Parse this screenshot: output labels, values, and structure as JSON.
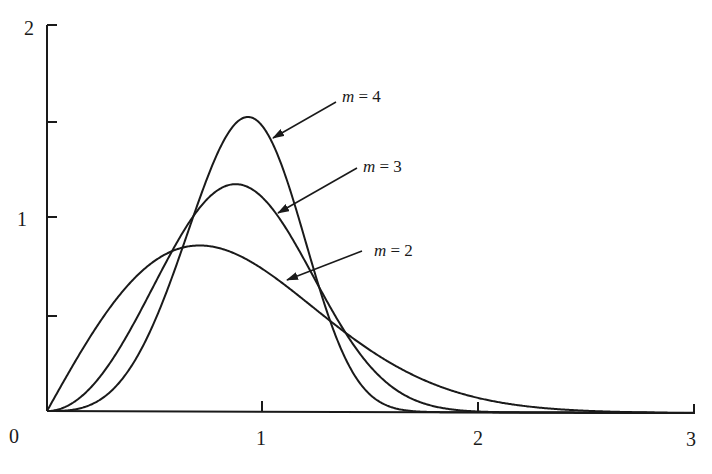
{
  "chart_data": {
    "type": "line",
    "title": "",
    "xlabel": "",
    "ylabel": "",
    "xlim": [
      0,
      3
    ],
    "ylim": [
      0,
      2
    ],
    "grid": false,
    "legend": "none (curves labeled by arrow annotations)",
    "x_ticks": [
      0,
      1,
      2,
      3
    ],
    "x_tick_labels": [
      "0",
      "1",
      "2",
      "3"
    ],
    "y_ticks": [
      0.5,
      1,
      1.5,
      2
    ],
    "y_tick_labels": [
      "",
      "1",
      "",
      "2"
    ],
    "series": [
      {
        "name": "m = 2",
        "shape": 2,
        "x": [
          0,
          0.25,
          0.5,
          0.707,
          1.0,
          1.25,
          1.5,
          2.0,
          2.5,
          3.0
        ],
        "values": [
          0,
          0.47,
          0.78,
          0.86,
          0.74,
          0.52,
          0.32,
          0.07,
          0.01,
          0.0
        ]
      },
      {
        "name": "m = 3",
        "shape": 3,
        "x": [
          0,
          0.25,
          0.5,
          0.874,
          1.0,
          1.25,
          1.5,
          1.75,
          2.0
        ],
        "values": [
          0,
          0.18,
          0.66,
          1.15,
          1.1,
          0.66,
          0.23,
          0.04,
          0.0
        ]
      },
      {
        "name": "m = 4",
        "shape": 4,
        "x": [
          0,
          0.25,
          0.5,
          0.93,
          1.0,
          1.25,
          1.5,
          1.65
        ],
        "values": [
          0,
          0.06,
          0.47,
          1.49,
          1.47,
          0.67,
          0.08,
          0.0
        ]
      }
    ],
    "annotations": [
      {
        "text": "m = 4",
        "points_to": "m = 4 curve, right flank near x≈1.0"
      },
      {
        "text": "m = 3",
        "points_to": "m = 3 curve, right flank near x≈1.05"
      },
      {
        "text": "m = 2",
        "points_to": "m = 2 curve, right flank near x≈1.1"
      }
    ]
  },
  "labels": {
    "x0": "0",
    "x1": "1",
    "x2": "2",
    "x3": "3",
    "y1": "1",
    "y2": "2",
    "ann_m4_var": "m",
    "ann_m4_rest": " = 4",
    "ann_m3_var": "m",
    "ann_m3_rest": " = 3",
    "ann_m2_var": "m",
    "ann_m2_rest": " = 2"
  }
}
